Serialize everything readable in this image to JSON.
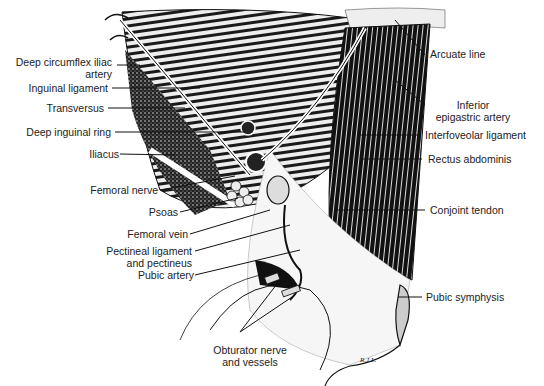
{
  "figure": {
    "signature": "R.J.L.",
    "labels_left": [
      {
        "id": "deep-circumflex-iliac-artery",
        "line1": "Deep circumflex iliac",
        "line2": "artery"
      },
      {
        "id": "inguinal-ligament",
        "line1": "Inguinal ligament"
      },
      {
        "id": "transversus",
        "line1": "Transversus"
      },
      {
        "id": "deep-inguinal-ring",
        "line1": "Deep inguinal ring"
      },
      {
        "id": "iliacus",
        "line1": "Iliacus"
      },
      {
        "id": "femoral-nerve",
        "line1": "Femoral nerve"
      },
      {
        "id": "psoas",
        "line1": "Psoas"
      },
      {
        "id": "femoral-vein",
        "line1": "Femoral vein"
      },
      {
        "id": "pectineal-ligament",
        "line1": "Pectineal ligament",
        "line2": "and pectineus"
      },
      {
        "id": "pubic-artery",
        "line1": "Pubic artery"
      }
    ],
    "labels_right": [
      {
        "id": "arcuate-line",
        "line1": "Arcuate line"
      },
      {
        "id": "inferior-epigastric-artery",
        "line1": "Inferior",
        "line2": "epigastric artery"
      },
      {
        "id": "interfoveolar-ligament",
        "line1": "Interfoveolar ligament"
      },
      {
        "id": "rectus-abdominis",
        "line1": "Rectus abdominis"
      },
      {
        "id": "conjoint-tendon",
        "line1": "Conjoint tendon"
      },
      {
        "id": "pubic-symphysis",
        "line1": "Pubic symphysis"
      }
    ],
    "labels_bottom": [
      {
        "id": "obturator-nerve-and-vessels",
        "line1": "Obturator nerve",
        "line2": "and vessels"
      }
    ]
  }
}
